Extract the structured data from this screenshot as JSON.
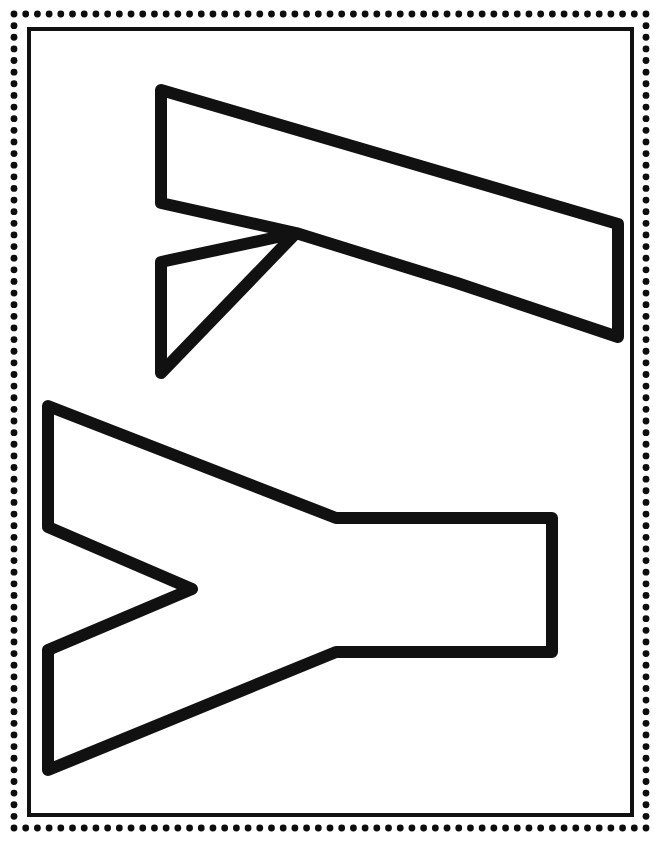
{
  "page": {
    "width": 660,
    "height": 842,
    "background_color": "#ffffff",
    "ink_color": "#111111",
    "style": "black outline coloring page, no text labels"
  },
  "border": {
    "name": "dotted-decorative-border",
    "dot_color": "#0d0d0d",
    "dot_radius": 3.4,
    "dot_spacing": 11.6,
    "left": 14,
    "top": 14,
    "right": 646,
    "bottom": 828
  },
  "inner_frame": {
    "name": "thin-rectangle-frame",
    "stroke_color": "#111111",
    "stroke_width": 4,
    "x": 29,
    "y": 29,
    "width": 603,
    "height": 786
  },
  "shapes": [
    {
      "id": "shape-top",
      "name": "rotated-letter-w-outline",
      "description": "Block letter W rotated 90 degrees clockwise, open outline",
      "stroke_width": 12,
      "stroke_color": "#111111",
      "fill": "none",
      "bounds": {
        "x": 155,
        "y": 84,
        "width": 468,
        "height": 295
      },
      "points": [
        [
          161,
          90
        ],
        [
          618,
          224
        ],
        [
          618,
          337
        ],
        [
          457,
          283
        ],
        [
          296,
          233
        ],
        [
          161,
          262
        ],
        [
          161,
          373
        ],
        [
          296,
          233
        ],
        [
          161,
          203
        ],
        [
          161,
          90
        ]
      ]
    },
    {
      "id": "shape-bottom",
      "name": "rotated-letter-y-outline",
      "description": "Block letter Y rotated 90 degrees clockwise, open outline",
      "stroke_width": 12,
      "stroke_color": "#111111",
      "fill": "none",
      "bounds": {
        "x": 42,
        "y": 400,
        "width": 519,
        "height": 376
      },
      "points": [
        [
          48,
          406
        ],
        [
          336,
          518
        ],
        [
          552,
          518
        ],
        [
          552,
          652
        ],
        [
          336,
          652
        ],
        [
          48,
          770
        ],
        [
          48,
          650
        ],
        [
          192,
          589
        ],
        [
          48,
          527
        ],
        [
          48,
          406
        ]
      ]
    }
  ],
  "chart_data": {
    "type": "table",
    "categories": [
      "shape-top",
      "shape-bottom"
    ],
    "values": [
      1,
      1
    ],
    "annotations": [
      "Top figure: outlined block letter W, rotated 90 degrees",
      "Bottom figure: outlined block letter Y, rotated 90 degrees"
    ],
    "xlabel": "",
    "ylabel": "",
    "grid": false,
    "legend": "none"
  }
}
